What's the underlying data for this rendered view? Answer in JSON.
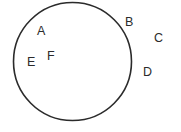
{
  "figure": {
    "type": "geometry-diagram",
    "background_color": "#ffffff",
    "stroke_color": "#2b2b2b",
    "label_color": "#2b2b2b"
  },
  "shapes": [
    {
      "name": "circle",
      "kind": "circle",
      "cx": 72.5,
      "cy": 61.5,
      "r": 59,
      "stroke": "#2b2b2b",
      "stroke_width": 1.6,
      "fill": "none"
    }
  ],
  "labels": [
    {
      "id": "A",
      "text": "A",
      "x": 37,
      "y": 25,
      "region": "inside"
    },
    {
      "id": "B",
      "text": "B",
      "x": 125,
      "y": 16,
      "region": "on-boundary"
    },
    {
      "id": "C",
      "text": "C",
      "x": 154,
      "y": 32,
      "region": "outside"
    },
    {
      "id": "D",
      "text": "D",
      "x": 143,
      "y": 66,
      "region": "outside"
    },
    {
      "id": "E",
      "text": "E",
      "x": 27,
      "y": 56,
      "region": "inside"
    },
    {
      "id": "F",
      "text": "F",
      "x": 47,
      "y": 50,
      "region": "inside"
    }
  ]
}
